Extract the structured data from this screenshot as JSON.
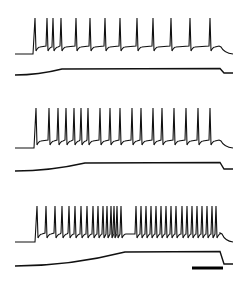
{
  "figure": {
    "panels": [
      {
        "id": "A",
        "voltage_baseline_y": 54,
        "voltage_plateau_y": 47,
        "spike_top_y": 18,
        "spike_times_px": [
          35,
          47,
          53,
          61,
          76,
          90,
          105,
          120,
          137,
          153,
          171,
          190,
          210
        ],
        "end_x": 220,
        "current": {
          "start_y": 75,
          "plateau_y": 69,
          "ramp_start_x": 15,
          "ramp_end_x": 62,
          "step_x": 220,
          "end_y": 73
        }
      },
      {
        "id": "B",
        "voltage_baseline_y": 148,
        "voltage_plateau_y": 141,
        "spike_top_y": 108,
        "spike_times_px": [
          36,
          49,
          58,
          66,
          74,
          81,
          88,
          100,
          110,
          120,
          132,
          141,
          153,
          162,
          174,
          186,
          198,
          210
        ],
        "end_x": 220,
        "current": {
          "start_y": 171,
          "plateau_y": 163,
          "ramp_start_x": 15,
          "ramp_end_x": 85,
          "step_x": 220,
          "end_y": 169
        }
      },
      {
        "id": "C",
        "voltage_baseline_y": 242,
        "voltage_plateau_y": 234,
        "spike_top_y": 206,
        "spike_times_px": [
          37,
          46,
          55,
          62,
          69,
          75,
          81,
          87,
          93,
          98,
          103,
          107,
          111,
          114,
          117,
          121,
          136,
          141,
          146,
          151,
          156,
          161,
          166,
          171,
          176,
          182,
          187,
          192,
          197,
          202,
          207,
          212,
          216
        ],
        "end_x": 221,
        "current": {
          "start_y": 266,
          "plateau_y": 252,
          "ramp_start_x": 15,
          "ramp_end_x": 125,
          "step_x": 220,
          "end_y": 264
        }
      }
    ],
    "scale_bar": {
      "x1": 192,
      "x2": 223,
      "y": 268,
      "label": ""
    }
  }
}
